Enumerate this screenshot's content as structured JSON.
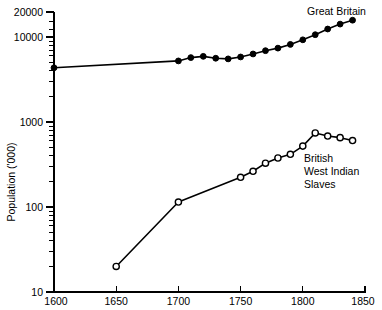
{
  "chart_data": {
    "type": "line",
    "title": "",
    "subtitle": "",
    "xlabel": "",
    "ylabel": "Population ('000)",
    "xlim": [
      1600,
      1850
    ],
    "ylim": [
      10,
      20000
    ],
    "yscale": "log",
    "xscale": "linear",
    "grid": false,
    "legend_position": "inline-annotation",
    "xticks": [
      1600,
      1650,
      1700,
      1750,
      1800,
      1850
    ],
    "xtick_labels": [
      "1600",
      "1650",
      "1700",
      "1750",
      "1800",
      "1850"
    ],
    "yticks": [
      10,
      100,
      1000,
      10000,
      20000
    ],
    "ytick_labels": [
      "10",
      "100",
      "1000",
      "10000",
      "20000"
    ],
    "series": [
      {
        "name": "Great Britain",
        "marker": "filled-circle",
        "x": [
          1600,
          1700,
          1710,
          1720,
          1730,
          1740,
          1750,
          1760,
          1770,
          1780,
          1790,
          1800,
          1810,
          1820,
          1830,
          1840
        ],
        "values": [
          4400,
          5300,
          5800,
          6000,
          5700,
          5600,
          5900,
          6400,
          7000,
          7500,
          8300,
          9400,
          10800,
          12600,
          14400,
          16000
        ]
      },
      {
        "name": "British West Indian Slaves",
        "marker": "open-circle",
        "x": [
          1650,
          1700,
          1750,
          1760,
          1770,
          1780,
          1790,
          1800,
          1810,
          1820,
          1830,
          1840
        ],
        "values": [
          20,
          115,
          225,
          265,
          330,
          380,
          420,
          525,
          750,
          690,
          660,
          610
        ]
      }
    ],
    "annotations": [
      {
        "id": "annotation-great-britain",
        "text": "Great Britain",
        "lines": [
          "Great Britain"
        ],
        "x_px": 307,
        "y_px": 15
      },
      {
        "id": "annotation-bwi-slaves",
        "text": "British West Indian Slaves",
        "lines": [
          "British",
          "West Indian",
          "Slaves"
        ],
        "x_px": 304,
        "y_px": 158
      }
    ]
  }
}
